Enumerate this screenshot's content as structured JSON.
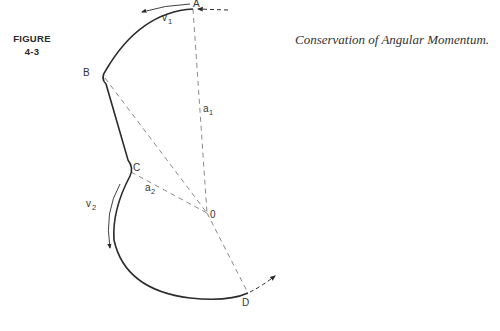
{
  "figure": {
    "label_line1": "FIGURE",
    "label_line2": "4-3",
    "caption": "Conservation of Angular Momentum."
  },
  "diagram": {
    "points": {
      "A": "A",
      "B": "B",
      "C": "C",
      "O": "0",
      "D": "D"
    },
    "vectors": {
      "v1": "v",
      "v1_sub": "1",
      "v2": "v",
      "v2_sub": "2"
    },
    "radii": {
      "a1": "a",
      "a1_sub": "1",
      "a2": "a",
      "a2_sub": "2"
    },
    "colors": {
      "path": "#2b2b2b",
      "dashed": "#8a8a8a"
    }
  }
}
